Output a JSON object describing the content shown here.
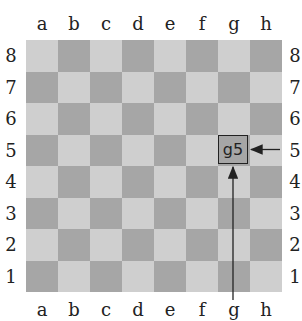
{
  "board": {
    "files": [
      "a",
      "b",
      "c",
      "d",
      "e",
      "f",
      "g",
      "h"
    ],
    "ranks": [
      "8",
      "7",
      "6",
      "5",
      "4",
      "3",
      "2",
      "1"
    ],
    "colors": {
      "light": "#cfcfcf",
      "dark": "#a6a6a6"
    }
  },
  "highlight": {
    "square": "g5",
    "label": "g5"
  },
  "arrows": [
    {
      "from": "rank-label-5",
      "to": "g5"
    },
    {
      "from": "file-label-g",
      "to": "g5"
    }
  ]
}
